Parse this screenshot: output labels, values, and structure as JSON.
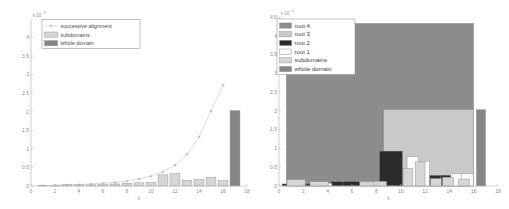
{
  "figure": {
    "panels": [
      {
        "name": "left-panel",
        "exponent_mantissa": "x 10",
        "exponent_power": "-3"
      },
      {
        "name": "right-panel",
        "exponent_mantissa": "x 10",
        "exponent_power": "-3"
      }
    ]
  },
  "colors": {
    "root4": "#8c8c8c",
    "root3": "#c9c9c9",
    "root2": "#2b2b2b",
    "root1": "#fcfcfc",
    "subdomains": "#d6d6d6",
    "whole_domain": "#868686",
    "curve": "#c8c8c8",
    "axis": "#b9b9b9",
    "edge": "#8e8e8e"
  },
  "chart_data": [
    {
      "type": "bar",
      "name": "left-chart",
      "title": "",
      "xlabel": "k",
      "ylabel": "",
      "xlim": [
        0,
        18
      ],
      "ylim": [
        0,
        4.5
      ],
      "y_scale_exponent": -3,
      "grid": false,
      "legend_position": "top-left",
      "xticks": [
        0,
        2,
        4,
        6,
        8,
        10,
        12,
        14,
        16,
        18
      ],
      "xticklabels": [
        "0",
        "2",
        "4",
        "6",
        "8",
        "10",
        "12",
        "14",
        "16",
        "18"
      ],
      "yticks": [
        0,
        0.5,
        1,
        1.5,
        2,
        2.5,
        3,
        3.5,
        4
      ],
      "yticklabels": [
        "0",
        "0.5",
        "1",
        "1.5",
        "2",
        "2.5",
        "3",
        "3.5",
        "4"
      ],
      "legend": [
        {
          "label": "successive alignment",
          "marker": "line-plus",
          "color": "#c8c8c8"
        },
        {
          "label": "subdomains",
          "marker": "patch",
          "color": "#d6d6d6"
        },
        {
          "label": "whole domain",
          "marker": "patch",
          "color": "#868686"
        }
      ],
      "series": [
        {
          "name": "subdomains",
          "kind": "bar",
          "color": "#d6d6d6",
          "x": [
            1,
            2,
            3,
            4,
            5,
            6,
            7,
            8,
            9,
            10,
            11,
            12,
            13,
            14,
            15,
            16
          ],
          "values": [
            0.01,
            0.02,
            0.045,
            0.04,
            0.03,
            0.035,
            0.055,
            0.075,
            0.085,
            0.095,
            0.3,
            0.33,
            0.155,
            0.175,
            0.235,
            0.145
          ]
        },
        {
          "name": "whole domain",
          "kind": "bar",
          "color": "#868686",
          "x": [
            17
          ],
          "values": [
            2.03
          ]
        },
        {
          "name": "successive alignment",
          "kind": "line",
          "color": "#c8c8c8",
          "marker": "plus",
          "x": [
            1,
            2,
            3,
            4,
            5,
            6,
            7,
            8,
            9,
            10,
            11,
            12,
            13,
            14,
            15,
            16
          ],
          "values": [
            0.012,
            0.02,
            0.03,
            0.04,
            0.055,
            0.075,
            0.1,
            0.135,
            0.19,
            0.265,
            0.38,
            0.56,
            0.85,
            1.32,
            2.02,
            2.72
          ]
        }
      ]
    },
    {
      "type": "bar",
      "name": "right-chart",
      "title": "",
      "xlabel": "k",
      "ylabel": "",
      "xlim": [
        0,
        18
      ],
      "ylim": [
        0,
        4.5
      ],
      "y_scale_exponent": -3,
      "grid": false,
      "legend_position": "top-left",
      "xticks": [
        0,
        2,
        4,
        6,
        8,
        10,
        12,
        14,
        16,
        18
      ],
      "xticklabels": [
        "0",
        "2",
        "4",
        "6",
        "8",
        "10",
        "12",
        "14",
        "16",
        "18"
      ],
      "yticks": [
        0,
        0.5,
        1,
        1.5,
        2,
        2.5,
        3,
        3.5,
        4,
        4.5
      ],
      "yticklabels": [
        "0",
        "0.5",
        "1",
        "1.5",
        "2",
        "2.5",
        "3",
        "3.5",
        "4",
        "4.5"
      ],
      "legend": [
        {
          "label": "root 4",
          "marker": "patch",
          "color": "#8c8c8c"
        },
        {
          "label": "root 3",
          "marker": "patch",
          "color": "#c9c9c9"
        },
        {
          "label": "root 2",
          "marker": "patch",
          "color": "#2b2b2b"
        },
        {
          "label": "root 1",
          "marker": "patch",
          "color": "#fcfcfc"
        },
        {
          "label": "subdomains",
          "marker": "patch",
          "color": "#d6d6d6"
        },
        {
          "label": "whole domain",
          "marker": "patch",
          "color": "#868686"
        }
      ],
      "series": [
        {
          "name": "root 4",
          "kind": "bar-span",
          "color": "#8c8c8c",
          "spans": [
            {
              "x0": 0.6,
              "x1": 16.0,
              "value": 4.33
            }
          ]
        },
        {
          "name": "root 3",
          "kind": "bar-span",
          "color": "#c9c9c9",
          "spans": [
            {
              "x0": 8.6,
              "x1": 16.0,
              "value": 2.03
            }
          ]
        },
        {
          "name": "root 2",
          "kind": "bar",
          "color": "#2b2b2b",
          "x": [
            1.2,
            2.2,
            3.2,
            5.2,
            6.2,
            9.2,
            13.2,
            14.2
          ],
          "widths": [
            1.9,
            1.9,
            1.9,
            1.9,
            1.9,
            1.9,
            1.9,
            1.9
          ],
          "values": [
            0.055,
            0.055,
            0.055,
            0.115,
            0.115,
            0.93,
            0.285,
            0.285
          ]
        },
        {
          "name": "root 1",
          "kind": "bar",
          "color": "#fcfcfc",
          "x": [
            3.6,
            7.4,
            11.0,
            11.9,
            14.6,
            15.5
          ],
          "widths": [
            1.5,
            1.5,
            0.95,
            0.95,
            0.95,
            0.95
          ],
          "values": [
            0.075,
            0.115,
            0.78,
            0.66,
            0.325,
            0.325
          ]
        },
        {
          "name": "subdomains",
          "kind": "bar",
          "color": "#d6d6d6",
          "x": [
            1.4,
            3.3,
            7.2,
            8.3,
            10.6,
            11.6,
            12.9,
            13.9,
            15.2
          ],
          "widths": [
            1.5,
            1.5,
            1.1,
            1.1,
            0.8,
            0.8,
            0.9,
            0.9,
            0.9
          ],
          "values": [
            0.17,
            0.115,
            0.11,
            0.125,
            0.47,
            0.64,
            0.2,
            0.235,
            0.185
          ]
        },
        {
          "name": "whole domain",
          "kind": "bar",
          "color": "#868686",
          "x": [
            16.6
          ],
          "widths": [
            0.75
          ],
          "values": [
            2.03
          ]
        }
      ]
    }
  ]
}
